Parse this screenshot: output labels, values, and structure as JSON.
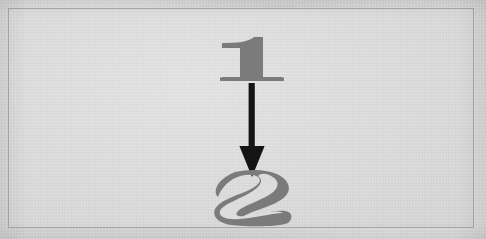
{
  "figure": {
    "kind": "diagram",
    "caption": "",
    "background_color": "#d4d4d4",
    "plate_color": "#dcdcdc",
    "frame_border_color": "#a9a9a9",
    "glyph_color": "#7b7b7b",
    "glyph_counter_color": "#dcdcdc",
    "arrow_color": "#141414"
  },
  "nodes": [
    {
      "id": "one",
      "label": "1",
      "icon_name": "numeral-one-glyph",
      "color": "#7b7b7b",
      "position": {
        "x": 243,
        "y": 51
      }
    },
    {
      "id": "two",
      "label": "2",
      "icon_name": "numeral-two-glyph",
      "color": "#7b7b7b",
      "position": {
        "x": 243,
        "y": 189
      }
    }
  ],
  "edges": [
    {
      "id": "one-to-two",
      "from": "one",
      "to": "two",
      "label": "",
      "direction": "down",
      "icon_name": "down-arrow-icon",
      "color": "#141414"
    }
  ]
}
